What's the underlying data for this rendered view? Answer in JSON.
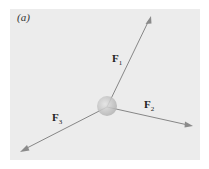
{
  "figure": {
    "panel_label": "(a)",
    "background_color": "#ececec",
    "arrow_color": "#7a7a7a",
    "body_color": "#c8c8c8"
  },
  "forces": [
    {
      "name": "F",
      "subscript": "1",
      "label": "F1",
      "direction": "up-right"
    },
    {
      "name": "F",
      "subscript": "2",
      "label": "F2",
      "direction": "right-slightly-down"
    },
    {
      "name": "F",
      "subscript": "3",
      "label": "F3",
      "direction": "down-left"
    }
  ]
}
